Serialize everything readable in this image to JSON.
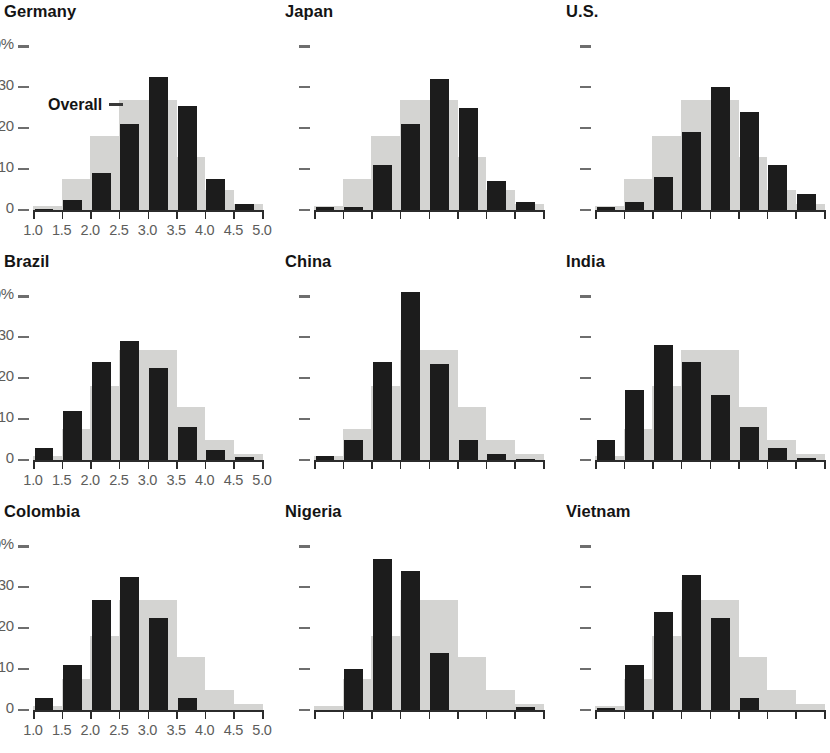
{
  "figure": {
    "annotation_label": "Overall",
    "y_axis": {
      "labels": [
        "40%",
        "30",
        "20",
        "10",
        "0"
      ],
      "values": [
        40,
        30,
        20,
        10,
        0
      ],
      "max": 44
    },
    "x_axis": {
      "labels": [
        "1.0",
        "1.5",
        "2.0",
        "2.5",
        "3.0",
        "3.5",
        "4.0",
        "4.5",
        "5.0"
      ],
      "min": 1.0,
      "max": 5.0,
      "step": 0.5
    },
    "colors": {
      "country_bar": "#1c1c1c",
      "overall_bar": "#d4d4d2",
      "axis": "#2b2b2b",
      "tick_label": "#5d5d5b",
      "title": "#141414"
    }
  },
  "chart_data": {
    "type": "bar",
    "title": "",
    "xlabel": "",
    "ylabel": "",
    "ylim": [
      0,
      44
    ],
    "grid": false,
    "legend_position": "inline-annotation",
    "categories": [
      "1.0",
      "1.5",
      "2.0",
      "2.5",
      "3.0",
      "3.5",
      "4.0",
      "4.5"
    ],
    "bin_edges": [
      1.0,
      1.5,
      2.0,
      2.5,
      3.0,
      3.5,
      4.0,
      4.5,
      5.0
    ],
    "legend": [
      "Overall",
      "Country"
    ],
    "panels": [
      {
        "name": "Germany",
        "show_y_labels": true,
        "show_x_labels": true,
        "show_annotation": true,
        "series": [
          {
            "name": "Overall",
            "values": [
              1.0,
              7.5,
              18.0,
              27.0,
              27.0,
              13.0,
              5.0,
              1.5
            ]
          },
          {
            "name": "Germany",
            "values": [
              0.3,
              2.5,
              9.0,
              21.0,
              32.5,
              25.5,
              7.5,
              1.5
            ]
          }
        ]
      },
      {
        "name": "Japan",
        "show_y_labels": false,
        "show_x_labels": false,
        "show_annotation": false,
        "series": [
          {
            "name": "Overall",
            "values": [
              1.0,
              7.5,
              18.0,
              27.0,
              27.0,
              13.0,
              5.0,
              1.5
            ]
          },
          {
            "name": "Japan",
            "values": [
              0.7,
              0.7,
              11.0,
              21.0,
              32.0,
              25.0,
              7.0,
              2.0
            ]
          }
        ]
      },
      {
        "name": "U.S.",
        "show_y_labels": false,
        "show_x_labels": false,
        "show_annotation": false,
        "series": [
          {
            "name": "Overall",
            "values": [
              1.0,
              7.5,
              18.0,
              27.0,
              27.0,
              13.0,
              5.0,
              1.5
            ]
          },
          {
            "name": "U.S.",
            "values": [
              0.8,
              2.0,
              8.0,
              19.0,
              30.0,
              24.0,
              11.0,
              4.0
            ]
          }
        ]
      },
      {
        "name": "Brazil",
        "show_y_labels": true,
        "show_x_labels": true,
        "show_annotation": false,
        "series": [
          {
            "name": "Overall",
            "values": [
              1.0,
              7.5,
              18.0,
              27.0,
              27.0,
              13.0,
              5.0,
              1.5
            ]
          },
          {
            "name": "Brazil",
            "values": [
              3.0,
              12.0,
              24.0,
              29.0,
              22.5,
              8.0,
              2.5,
              0.7
            ]
          }
        ]
      },
      {
        "name": "China",
        "show_y_labels": false,
        "show_x_labels": false,
        "show_annotation": false,
        "series": [
          {
            "name": "Overall",
            "values": [
              1.0,
              7.5,
              18.0,
              27.0,
              27.0,
              13.0,
              5.0,
              1.5
            ]
          },
          {
            "name": "China",
            "values": [
              1.0,
              5.0,
              24.0,
              41.0,
              23.5,
              5.0,
              1.5,
              0.3
            ]
          }
        ]
      },
      {
        "name": "India",
        "show_y_labels": false,
        "show_x_labels": false,
        "show_annotation": false,
        "series": [
          {
            "name": "Overall",
            "values": [
              1.0,
              7.5,
              18.0,
              27.0,
              27.0,
              13.0,
              5.0,
              1.5
            ]
          },
          {
            "name": "India",
            "values": [
              5.0,
              17.0,
              28.0,
              24.0,
              16.0,
              8.0,
              3.0,
              0.5
            ]
          }
        ]
      },
      {
        "name": "Colombia",
        "show_y_labels": true,
        "show_x_labels": true,
        "show_annotation": false,
        "series": [
          {
            "name": "Overall",
            "values": [
              1.0,
              7.5,
              18.0,
              27.0,
              27.0,
              13.0,
              5.0,
              1.5
            ]
          },
          {
            "name": "Colombia",
            "values": [
              3.0,
              11.0,
              27.0,
              32.5,
              22.5,
              3.0,
              0.0,
              0.0
            ]
          }
        ]
      },
      {
        "name": "Nigeria",
        "show_y_labels": false,
        "show_x_labels": false,
        "show_annotation": false,
        "series": [
          {
            "name": "Overall",
            "values": [
              1.0,
              7.5,
              18.0,
              27.0,
              27.0,
              13.0,
              5.0,
              1.5
            ]
          },
          {
            "name": "Nigeria",
            "values": [
              0.0,
              10.0,
              37.0,
              34.0,
              14.0,
              0.0,
              0.0,
              0.8
            ]
          }
        ]
      },
      {
        "name": "Vietnam",
        "show_y_labels": false,
        "show_x_labels": false,
        "show_annotation": false,
        "series": [
          {
            "name": "Overall",
            "values": [
              1.0,
              7.5,
              18.0,
              27.0,
              27.0,
              13.0,
              5.0,
              1.5
            ]
          },
          {
            "name": "Vietnam",
            "values": [
              0.5,
              11.0,
              24.0,
              33.0,
              22.5,
              3.0,
              0.0,
              0.0
            ]
          }
        ]
      }
    ]
  }
}
